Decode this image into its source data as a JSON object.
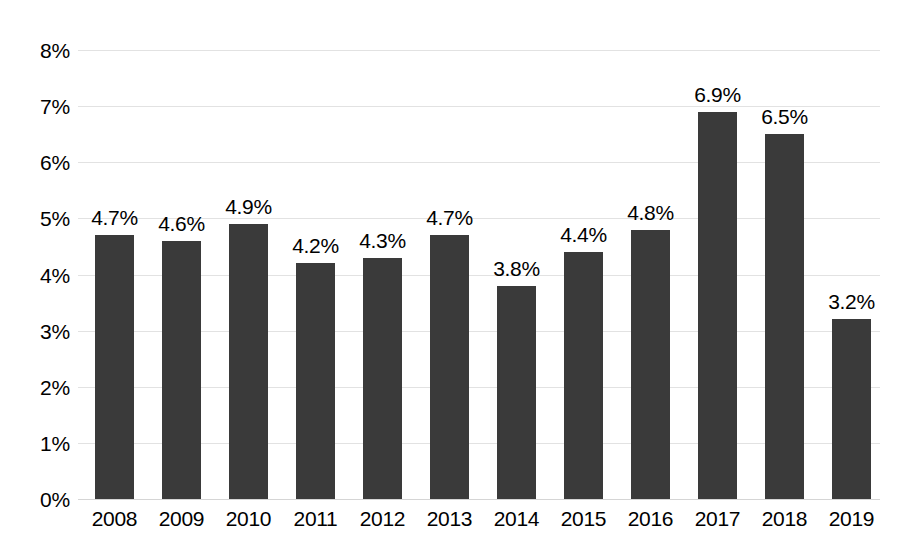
{
  "chart_data": {
    "type": "bar",
    "title": "",
    "xlabel": "",
    "ylabel": "",
    "categories": [
      "2008",
      "2009",
      "2010",
      "2011",
      "2012",
      "2013",
      "2014",
      "2015",
      "2016",
      "2017",
      "2018",
      "2019"
    ],
    "values": [
      4.7,
      4.6,
      4.9,
      4.2,
      4.3,
      4.7,
      3.8,
      4.4,
      4.8,
      6.9,
      6.5,
      3.2
    ],
    "data_labels": [
      "4.7%",
      "4.6%",
      "4.9%",
      "4.2%",
      "4.3%",
      "4.7%",
      "3.8%",
      "4.4%",
      "4.8%",
      "6.9%",
      "6.5%",
      "3.2%"
    ],
    "ylim": [
      0,
      8
    ],
    "ytick_values": [
      8,
      7,
      6,
      5,
      4,
      3,
      2,
      1,
      0
    ],
    "ytick_labels": [
      "8%",
      "7%",
      "6%",
      "5%",
      "4%",
      "3%",
      "2%",
      "1%",
      "0%"
    ],
    "grid": true,
    "legend": false,
    "legend_position": "none",
    "series_name": "",
    "colors": {
      "bar": "#3a3a3a",
      "gridline": "#e2e2e2",
      "background": "#ffffff",
      "text": "#000000"
    }
  }
}
